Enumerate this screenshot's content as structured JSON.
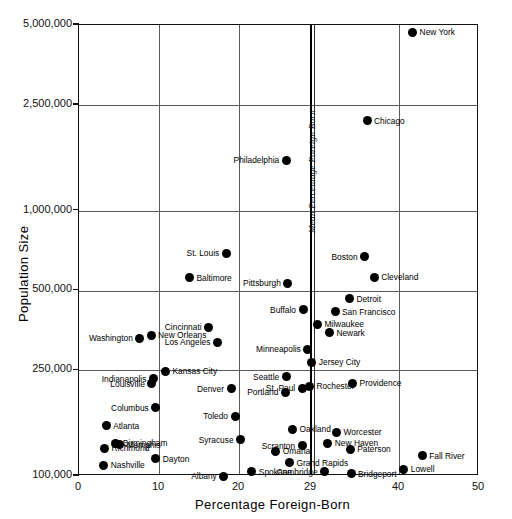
{
  "chart_data": {
    "type": "scatter",
    "title": "",
    "xlabel": "Percentage  Foreign-Born",
    "ylabel": "Population  Size",
    "xlim": [
      0,
      50
    ],
    "ylim": [
      100000,
      5000000
    ],
    "yscale": "log",
    "xticks": [
      "0",
      "10",
      "20",
      "29",
      "40",
      "50"
    ],
    "xtick_values": [
      0,
      10,
      20,
      29,
      40,
      50
    ],
    "yticks": [
      "5,000,000",
      "2,500,000",
      "1,000,000",
      "500,000",
      "250,000",
      "100,000"
    ],
    "ytick_values": [
      5000000,
      2500000,
      1000000,
      500000,
      250000,
      100000
    ],
    "grid": true,
    "gridlines_x": [
      10,
      20,
      29,
      40
    ],
    "gridlines_y": [
      2500000,
      1000000,
      500000,
      250000
    ],
    "annotations": [
      {
        "text": "Mean Percentage Foreign Born",
        "x": 29,
        "orientation": "vertical",
        "style": "italic"
      }
    ],
    "points": [
      {
        "label": "New York",
        "x": 41.7,
        "y": 4690000,
        "side": "r"
      },
      {
        "label": "Chicago",
        "x": 36.0,
        "y": 2180000,
        "side": "r"
      },
      {
        "label": "Philadelphia",
        "x": 25.9,
        "y": 1550000,
        "side": "l"
      },
      {
        "label": "St. Louis",
        "x": 18.4,
        "y": 690000,
        "side": "l"
      },
      {
        "label": "Boston",
        "x": 35.7,
        "y": 670000,
        "side": "l"
      },
      {
        "label": "Cleveland",
        "x": 36.9,
        "y": 560000,
        "side": "r"
      },
      {
        "label": "Baltimore",
        "x": 13.8,
        "y": 558000,
        "side": "r"
      },
      {
        "label": "Pittsburgh",
        "x": 26.1,
        "y": 533000,
        "side": "l"
      },
      {
        "label": "Detroit",
        "x": 33.8,
        "y": 465000,
        "side": "r"
      },
      {
        "label": "San Francisco",
        "x": 32.0,
        "y": 416000,
        "side": "r"
      },
      {
        "label": "Buffalo",
        "x": 28.0,
        "y": 423000,
        "side": "l"
      },
      {
        "label": "Milwaukee",
        "x": 29.8,
        "y": 373000,
        "side": "r"
      },
      {
        "label": "Cincinnati",
        "x": 16.2,
        "y": 363000,
        "side": "l"
      },
      {
        "label": "Newark",
        "x": 31.3,
        "y": 347000,
        "side": "r"
      },
      {
        "label": "New Orleans",
        "x": 9.0,
        "y": 339000,
        "side": "r"
      },
      {
        "label": "Washington",
        "x": 7.6,
        "y": 331000,
        "side": "l"
      },
      {
        "label": "Los Angeles",
        "x": 17.3,
        "y": 319000,
        "side": "l"
      },
      {
        "label": "Minneapolis",
        "x": 28.6,
        "y": 301000,
        "side": "l"
      },
      {
        "label": "Jersey City",
        "x": 29.1,
        "y": 268000,
        "side": "r"
      },
      {
        "label": "Kansas City",
        "x": 10.8,
        "y": 248000,
        "side": "r"
      },
      {
        "label": "Indianapolis",
        "x": 9.3,
        "y": 233000,
        "side": "l"
      },
      {
        "label": "Seattle",
        "x": 25.9,
        "y": 237000,
        "side": "l"
      },
      {
        "label": "Providence",
        "x": 34.2,
        "y": 224000,
        "side": "r"
      },
      {
        "label": "Rochester",
        "x": 28.8,
        "y": 218000,
        "side": "r"
      },
      {
        "label": "Louisville",
        "x": 9.1,
        "y": 223000,
        "side": "l"
      },
      {
        "label": "St. Paul",
        "x": 27.9,
        "y": 214000,
        "side": "l"
      },
      {
        "label": "Denver",
        "x": 19.0,
        "y": 213000,
        "side": "l"
      },
      {
        "label": "Portland",
        "x": 25.8,
        "y": 207000,
        "side": "l"
      },
      {
        "label": "Columbus",
        "x": 9.6,
        "y": 181000,
        "side": "l"
      },
      {
        "label": "Toledo",
        "x": 19.5,
        "y": 168000,
        "side": "l"
      },
      {
        "label": "Oakland",
        "x": 26.7,
        "y": 150000,
        "side": "r"
      },
      {
        "label": "Atlanta",
        "x": 3.4,
        "y": 155000,
        "side": "r"
      },
      {
        "label": "Worcester",
        "x": 32.2,
        "y": 146000,
        "side": "r"
      },
      {
        "label": "Syracuse",
        "x": 20.2,
        "y": 137000,
        "side": "l"
      },
      {
        "label": "Birmingham",
        "x": 4.6,
        "y": 133000,
        "side": "r"
      },
      {
        "label": "Scranton",
        "x": 27.9,
        "y": 130000,
        "side": "l"
      },
      {
        "label": "New Haven",
        "x": 31.1,
        "y": 133000,
        "side": "r"
      },
      {
        "label": "Memphis",
        "x": 5.1,
        "y": 131000,
        "side": "r"
      },
      {
        "label": "Richmond",
        "x": 3.2,
        "y": 127000,
        "side": "r"
      },
      {
        "label": "Omaha",
        "x": 24.6,
        "y": 124000,
        "side": "r"
      },
      {
        "label": "Dayton",
        "x": 9.6,
        "y": 116000,
        "side": "r"
      },
      {
        "label": "Paterson",
        "x": 33.9,
        "y": 126000,
        "side": "r"
      },
      {
        "label": "Grand Rapids",
        "x": 26.3,
        "y": 112000,
        "side": "r"
      },
      {
        "label": "Fall River",
        "x": 42.9,
        "y": 119000,
        "side": "r"
      },
      {
        "label": "Nashville",
        "x": 3.1,
        "y": 110000,
        "side": "r"
      },
      {
        "label": "Spokane",
        "x": 21.6,
        "y": 104000,
        "side": "r"
      },
      {
        "label": "Cambridge",
        "x": 30.7,
        "y": 104000,
        "side": "l"
      },
      {
        "label": "Albany",
        "x": 18.1,
        "y": 100000,
        "side": "l"
      },
      {
        "label": "Bridgeport",
        "x": 34.0,
        "y": 102000,
        "side": "r"
      },
      {
        "label": "Lowell",
        "x": 40.6,
        "y": 106000,
        "side": "r"
      }
    ]
  },
  "figure": {
    "caption": ""
  }
}
